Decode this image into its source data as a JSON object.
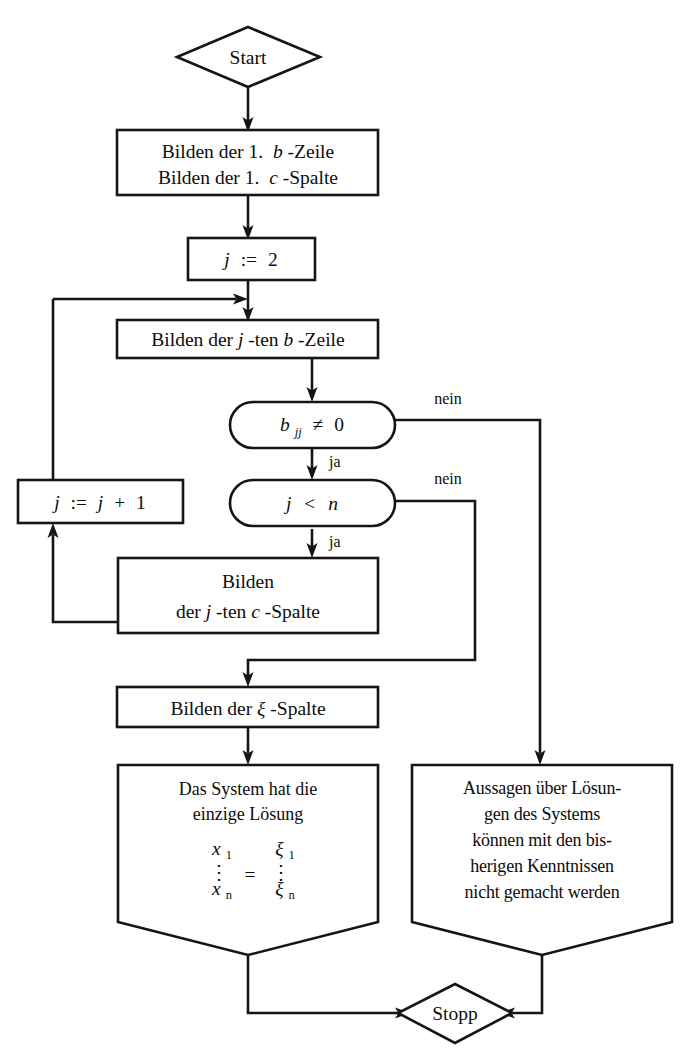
{
  "diagram": {
    "title_language": "de",
    "colors": {
      "stroke": "#151515",
      "fill": "#ffffff",
      "text": "#0d0d0d"
    },
    "nodes": {
      "start": {
        "label": "Start",
        "shape": "diamond"
      },
      "init": {
        "line1": "Bilden der 1.",
        "line1_var": "b",
        "line1_tail": "-Zeile",
        "line2": "Bilden der 1.",
        "line2_var": "c",
        "line2_tail": "-Spalte",
        "shape": "rect"
      },
      "assign_j2": {
        "var": "j",
        "op": ":=",
        "value": "2",
        "shape": "rect"
      },
      "b_row": {
        "pre": "Bilden der ",
        "var": "j",
        "mid": "-ten ",
        "var2": "b",
        "tail": "-Zeile",
        "shape": "rect"
      },
      "dec_pivot": {
        "var": "b",
        "sub": "jj",
        "rel": "≠",
        "value": "0",
        "shape": "stadium"
      },
      "dec_jn": {
        "var": "j",
        "rel": "<",
        "var2": "n",
        "shape": "stadium"
      },
      "incr_j": {
        "var": "j",
        "op": ":=",
        "var2": "j",
        "plus": "+",
        "value": "1",
        "shape": "rect"
      },
      "c_col": {
        "line1": "Bilden",
        "line2_pre": "der ",
        "line2_var": "j",
        "line2_mid": "-ten ",
        "line2_var2": "c",
        "line2_tail": "-Spalte",
        "shape": "rect"
      },
      "xi_col": {
        "pre": "Bilden der ",
        "var": "ξ",
        "tail": "-Spalte",
        "shape": "rect"
      },
      "result_ok": {
        "line1": "Das System hat die",
        "line2": "einzige Lösung",
        "matrix": {
          "lhs_top": "x",
          "lhs_top_sub": "1",
          "lhs_bot": "x",
          "lhs_bot_sub": "n",
          "equals": "=",
          "rhs_top": "ξ",
          "rhs_top_sub": "1",
          "rhs_bot": "ξ",
          "rhs_bot_sub": "n",
          "vdots": "⋮"
        },
        "shape": "pentagon"
      },
      "result_fail": {
        "line1": "Aussagen über Lösun-",
        "line2": "gen des Systems",
        "line3": "können mit den bis-",
        "line4": "herigen Kenntnissen",
        "line5": "nicht gemacht werden",
        "shape": "pentagon"
      },
      "stop": {
        "label": "Stopp",
        "shape": "diamond"
      }
    },
    "edge_labels": {
      "pivot_no": "nein",
      "pivot_yes": "ja",
      "jn_no": "nein",
      "jn_yes": "ja"
    }
  }
}
